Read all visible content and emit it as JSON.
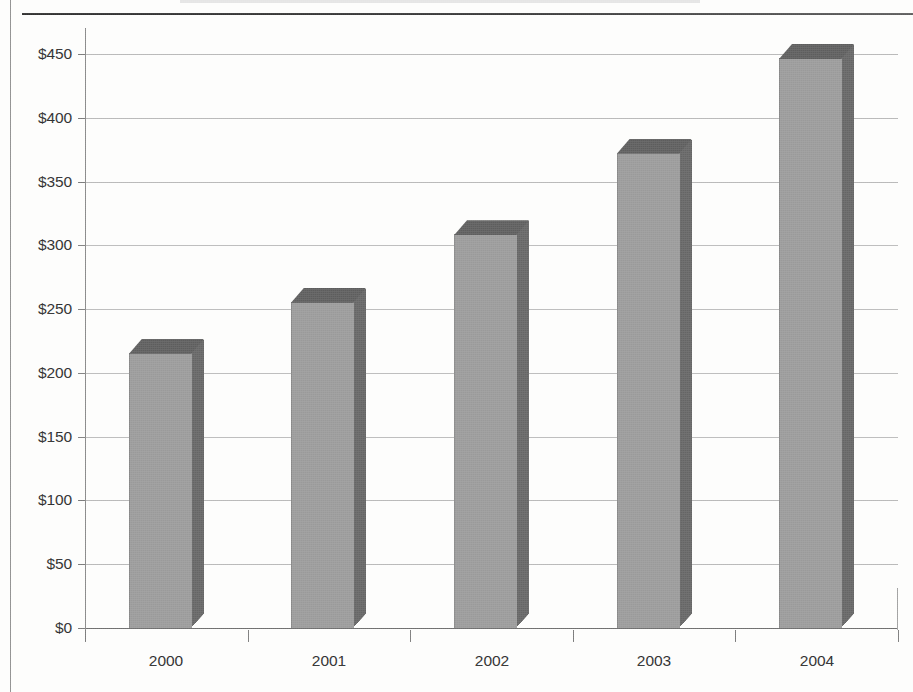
{
  "chart_data": {
    "type": "bar",
    "title": "",
    "subtitle": "",
    "xlabel": "",
    "ylabel": "",
    "categories": [
      "2000",
      "2001",
      "2002",
      "2003",
      "2004"
    ],
    "values": [
      215,
      255,
      308,
      372,
      446
    ],
    "series": [
      {
        "name": "",
        "values": [
          215,
          255,
          308,
          372,
          446
        ]
      }
    ],
    "ylim": [
      0,
      450
    ],
    "ytick_values": [
      0,
      50,
      100,
      150,
      200,
      250,
      300,
      350,
      400,
      450
    ],
    "ytick_labels": [
      "$0",
      "$50",
      "$100",
      "$150",
      "$200",
      "$250",
      "$300",
      "$350",
      "$400",
      "$450"
    ],
    "grid": true,
    "legend": false,
    "legend_position": "none",
    "style": "3d-column",
    "colors": {
      "bar_front": "#9a9a9a",
      "bar_side": "#656565",
      "bar_top": "#5d5d5d",
      "gridline": "#b9b9b9",
      "axis": "#7b7b7b",
      "text": "#2b2b2b",
      "background": "#fdfdfc",
      "rule": "#2f2f2f"
    }
  }
}
